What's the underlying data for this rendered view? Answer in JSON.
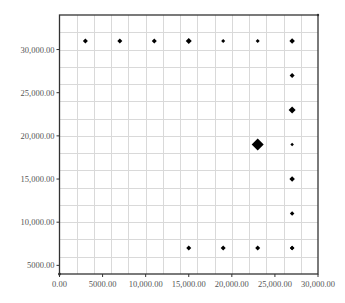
{
  "chart_data": {
    "type": "scatter",
    "title": "",
    "xlabel": "",
    "ylabel": "",
    "xlim": [
      0,
      30000
    ],
    "ylim": [
      4000,
      34000
    ],
    "grid": true,
    "grid_step": 2000,
    "legend": null,
    "x_ticks": [
      0,
      5000,
      10000,
      15000,
      20000,
      25000,
      30000
    ],
    "x_tick_labels": [
      "0.00",
      "5000.00",
      "10,000.00",
      "15,000.00",
      "20,000.00",
      "25,000.00",
      "30,000.00"
    ],
    "y_ticks": [
      5000,
      10000,
      15000,
      20000,
      25000,
      30000
    ],
    "y_tick_labels": [
      "5000.00",
      "10,000.00",
      "15,000.00",
      "20,000.00",
      "25,000.00",
      "30,000.00"
    ],
    "marker": "diamond",
    "points": [
      {
        "x": 3000,
        "y": 31000,
        "size": 5
      },
      {
        "x": 7000,
        "y": 31000,
        "size": 5
      },
      {
        "x": 11000,
        "y": 31000,
        "size": 5
      },
      {
        "x": 15000,
        "y": 31000,
        "size": 6
      },
      {
        "x": 19000,
        "y": 31000,
        "size": 4
      },
      {
        "x": 23000,
        "y": 31000,
        "size": 4
      },
      {
        "x": 27000,
        "y": 31000,
        "size": 5.5
      },
      {
        "x": 27000,
        "y": 27000,
        "size": 5
      },
      {
        "x": 27000,
        "y": 23000,
        "size": 7
      },
      {
        "x": 23000,
        "y": 19000,
        "size": 12
      },
      {
        "x": 27000,
        "y": 19000,
        "size": 3.5
      },
      {
        "x": 27000,
        "y": 15000,
        "size": 5.5
      },
      {
        "x": 27000,
        "y": 11000,
        "size": 4.5
      },
      {
        "x": 27000,
        "y": 7000,
        "size": 4.5
      },
      {
        "x": 15000,
        "y": 7000,
        "size": 5
      },
      {
        "x": 19000,
        "y": 7000,
        "size": 5
      },
      {
        "x": 23000,
        "y": 7000,
        "size": 5
      },
      {
        "x": 27000,
        "y": 7000,
        "size": 4.5
      }
    ]
  },
  "colors": {
    "marker": "#000000",
    "grid": "#d9d9d9",
    "axis": "#333333",
    "label": "#555555"
  }
}
